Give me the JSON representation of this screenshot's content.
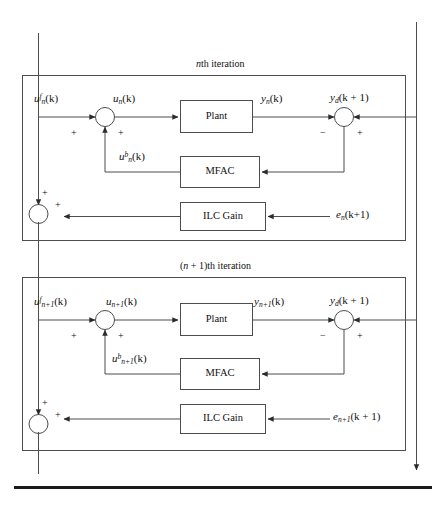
{
  "figure": {
    "type": "control-block-diagram",
    "caption_rule": true,
    "background": "#ffffff",
    "line_color": "#4d4d4d",
    "text_color": "#111111"
  },
  "sections": [
    {
      "id": "iteration-n",
      "title_plain": "nth iteration",
      "title_prefix": "n",
      "title_suffix": "th iteration",
      "feedforward_label": "u",
      "feedforward_sub": "n",
      "feedforward_sup": "f",
      "feedforward_arg": "(k)",
      "control_label": "u",
      "control_sub": "n",
      "control_arg": "(k)",
      "feedback_label": "u",
      "feedback_sub": "n",
      "feedback_sup": "b",
      "feedback_arg": "(k)",
      "output_label": "y",
      "output_sub": "n",
      "output_arg": "(k)",
      "desired_label": "y",
      "desired_sub": "d",
      "desired_arg": "(k + 1)",
      "error_label": "e",
      "error_sub": "n",
      "error_arg": "(k+1)",
      "plant_label": "Plant",
      "mfac_label": "MFAC",
      "ilc_label": "ILC Gain",
      "sum_signs": {
        "input_left": "+",
        "input_bottom": "+",
        "compare_left": "−",
        "compare_right": "+",
        "accum_top": "+",
        "accum_right": "+"
      }
    },
    {
      "id": "iteration-n-plus-1",
      "title_plain": "(n + 1)th iteration",
      "title_prefix": "(",
      "title_var": "n",
      "title_mid": " + 1)",
      "title_suffix": "th iteration",
      "feedforward_label": "u",
      "feedforward_sub": "n+1",
      "feedforward_sup": "f",
      "feedforward_arg": "(k)",
      "control_label": "u",
      "control_sub": "n+1",
      "control_arg": "(k)",
      "feedback_label": "u",
      "feedback_sub": "n+1",
      "feedback_sup": "b",
      "feedback_arg": "(k)",
      "output_label": "y",
      "output_sub": "n+1",
      "output_arg": "(k)",
      "desired_label": "y",
      "desired_sub": "d",
      "desired_arg": "(k + 1)",
      "error_label": "e",
      "error_sub": "n+1",
      "error_arg": "(k + 1)",
      "plant_label": "Plant",
      "mfac_label": "MFAC",
      "ilc_label": "ILC Gain",
      "sum_signs": {
        "input_left": "+",
        "input_bottom": "+",
        "compare_left": "−",
        "compare_right": "+",
        "accum_top": "+",
        "accum_right": "+"
      }
    }
  ]
}
